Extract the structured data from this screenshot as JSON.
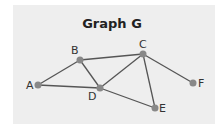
{
  "title": "Graph G",
  "colors": {
    "panel": "#eeeeee",
    "edge": "#555555",
    "node": "#888888",
    "text": "#222222"
  },
  "nodes": [
    {
      "id": "A",
      "label": "A"
    },
    {
      "id": "B",
      "label": "B"
    },
    {
      "id": "C",
      "label": "C"
    },
    {
      "id": "D",
      "label": "D"
    },
    {
      "id": "E",
      "label": "E"
    },
    {
      "id": "F",
      "label": "F"
    }
  ],
  "edges": [
    [
      "A",
      "B"
    ],
    [
      "A",
      "D"
    ],
    [
      "B",
      "C"
    ],
    [
      "B",
      "D"
    ],
    [
      "C",
      "D"
    ],
    [
      "C",
      "E"
    ],
    [
      "C",
      "F"
    ],
    [
      "D",
      "E"
    ]
  ]
}
